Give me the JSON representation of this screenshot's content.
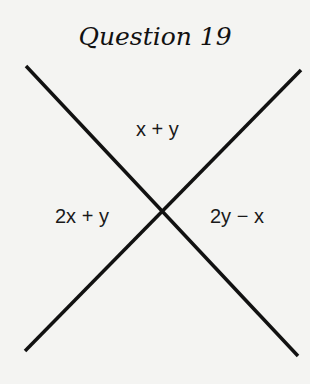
{
  "title": "Question 19",
  "diagram": {
    "type": "two intersecting lines",
    "lines": [
      {
        "from": [
          26,
          66
        ],
        "to": [
          298,
          356
        ]
      },
      {
        "from": [
          301,
          70
        ],
        "to": [
          25,
          351
        ]
      }
    ],
    "line_color": "#111111",
    "angle_labels": {
      "top": "x + y",
      "left": "2x + y",
      "right": "2y − x"
    }
  }
}
